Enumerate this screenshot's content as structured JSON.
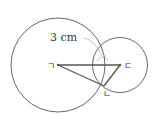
{
  "diagram": {
    "measure_label": "3 cm",
    "points": {
      "left_center": "ㄱ",
      "bottom_intersection": "ㄴ",
      "right_center": "ㄷ"
    },
    "colors": {
      "stroke": "#555555",
      "background": "#ffffff"
    }
  }
}
